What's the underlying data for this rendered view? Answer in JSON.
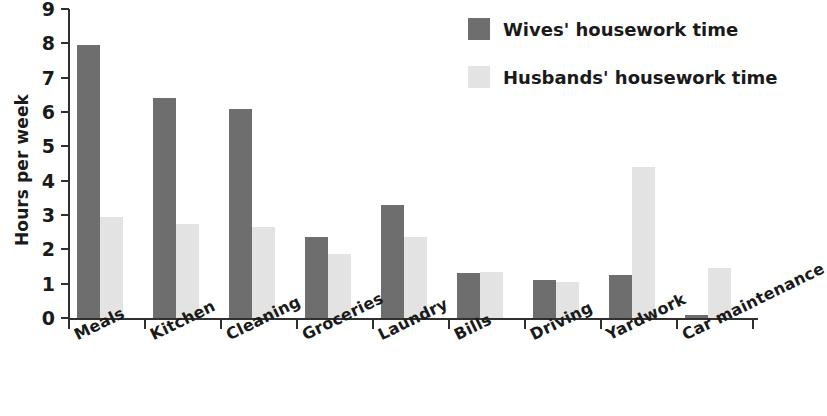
{
  "chart_data": {
    "type": "bar",
    "title": "",
    "xlabel": "",
    "ylabel": "Hours per week",
    "ylim": [
      0,
      9
    ],
    "yticks": [
      0,
      1,
      2,
      3,
      4,
      5,
      6,
      7,
      8,
      9
    ],
    "ytick_labels": [
      "0",
      "1",
      "2",
      "3",
      "4",
      "5",
      "6",
      "7",
      "8",
      "9"
    ],
    "grid": false,
    "legend_position": "top-right",
    "categories": [
      "Meals",
      "Kitchen",
      "Cleaning",
      "Groceries",
      "Laundry",
      "Bills",
      "Driving",
      "Yardwork",
      "Car maintenance"
    ],
    "series": [
      {
        "name": "Wives' housework time",
        "color": "#6e6e6e",
        "values": [
          7.95,
          6.4,
          6.1,
          2.35,
          3.3,
          1.3,
          1.1,
          1.25,
          0.1
        ]
      },
      {
        "name": "Husbands' housework time",
        "color": "#e3e3e3",
        "values": [
          2.95,
          2.75,
          2.65,
          1.85,
          2.35,
          1.35,
          1.05,
          4.4,
          1.45
        ]
      }
    ]
  },
  "legend": {
    "items": [
      {
        "label": "Wives' housework time",
        "swatch": "wives"
      },
      {
        "label": "Husbands' housework time",
        "swatch": "husbands"
      }
    ]
  }
}
